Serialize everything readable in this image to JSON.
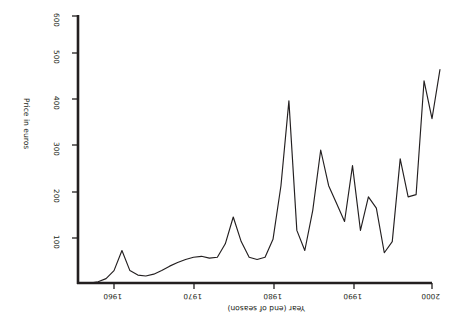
{
  "chart_data": {
    "type": "line",
    "title": "",
    "subtitle": "",
    "xlabel": "Year (end of season)",
    "ylabel": "Price in euros",
    "orientation": "rotated-180",
    "grid": false,
    "legend": null,
    "xlim": [
      1956,
      2003
    ],
    "ylim": [
      0,
      600
    ],
    "yaxis_inverted": true,
    "xaxis_reversed": true,
    "xticks": [
      1960,
      1970,
      1980,
      1990,
      2000
    ],
    "xticklabels": [
      "1960",
      "1970",
      "1980",
      "1990",
      "2000"
    ],
    "yticks": [
      100,
      200,
      300,
      400,
      500,
      600
    ],
    "yticklabels": [
      "100",
      "200",
      "300",
      "400",
      "500",
      "600"
    ],
    "series": [
      {
        "name": "Price",
        "x": [
          1957,
          1958,
          1959,
          1960,
          1961,
          1962,
          1963,
          1964,
          1965,
          1966,
          1967,
          1968,
          1969,
          1970,
          1971,
          1972,
          1973,
          1974,
          1975,
          1976,
          1977,
          1978,
          1979,
          1980,
          1981,
          1982,
          1983,
          1984,
          1985,
          1986,
          1987,
          1988,
          1989,
          1990,
          1991,
          1992,
          1993,
          1994,
          1995,
          1996,
          1997,
          1998,
          1999,
          2000,
          2001
        ],
        "y": [
          2,
          5,
          12,
          30,
          75,
          30,
          20,
          18,
          22,
          30,
          40,
          48,
          55,
          60,
          62,
          58,
          60,
          90,
          150,
          95,
          60,
          55,
          60,
          100,
          220,
          410,
          120,
          75,
          165,
          300,
          220,
          180,
          140,
          265,
          120,
          195,
          170,
          70,
          95,
          280,
          195,
          200,
          455,
          370,
          480
        ]
      }
    ]
  },
  "axes": {
    "x_title": "Year (end of season)",
    "y_title": "Price in euros",
    "x_tick_labels": [
      "2000",
      "1990",
      "1980",
      "1970",
      "1960"
    ],
    "y_tick_labels": [
      "100",
      "200",
      "300",
      "400",
      "500",
      "600"
    ]
  },
  "style": {
    "line_color": "#231f20",
    "axis_color": "#231f20",
    "background": "#ffffff"
  }
}
